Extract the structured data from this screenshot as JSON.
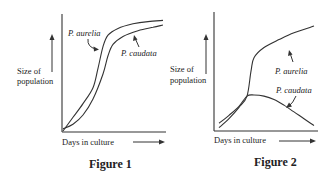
{
  "chart_data": [
    {
      "type": "line",
      "title": "Figure 1",
      "xlabel": "Days in culture",
      "ylabel": "Size of population",
      "axis_units": "qualitative (no ticks)",
      "grid": false,
      "series": [
        {
          "name": "P. aurelia",
          "label": "P. aurelia",
          "x": [
            0,
            0.1,
            0.2,
            0.3,
            0.35,
            0.4,
            0.45,
            0.55,
            0.7,
            0.85,
            1.0
          ],
          "y": [
            0,
            0.12,
            0.24,
            0.38,
            0.55,
            0.74,
            0.84,
            0.9,
            0.94,
            0.96,
            0.97
          ]
        },
        {
          "name": "P. caudata",
          "label": "P. caudata",
          "x": [
            0,
            0.1,
            0.2,
            0.3,
            0.4,
            0.45,
            0.5,
            0.6,
            0.75,
            0.9,
            1.0
          ],
          "y": [
            0.02,
            0.06,
            0.14,
            0.28,
            0.5,
            0.66,
            0.76,
            0.83,
            0.88,
            0.91,
            0.93
          ]
        }
      ]
    },
    {
      "type": "line",
      "title": "Figure 2",
      "xlabel": "Days in culture",
      "ylabel": "Size of population",
      "axis_units": "qualitative (no ticks)",
      "grid": false,
      "series": [
        {
          "name": "P. aurelia",
          "label": "P. aurelia",
          "x": [
            0.05,
            0.15,
            0.25,
            0.33,
            0.37,
            0.4,
            0.5,
            0.65,
            0.8,
            1.0
          ],
          "y": [
            0.02,
            0.1,
            0.2,
            0.3,
            0.52,
            0.64,
            0.73,
            0.8,
            0.86,
            0.92
          ]
        },
        {
          "name": "P. caudata",
          "label": "P. caudata",
          "x": [
            0.05,
            0.15,
            0.25,
            0.33,
            0.4,
            0.5,
            0.6,
            0.7,
            0.8,
            0.9,
            1.0
          ],
          "y": [
            0.06,
            0.13,
            0.21,
            0.3,
            0.31,
            0.3,
            0.27,
            0.22,
            0.16,
            0.1,
            0.04
          ]
        }
      ]
    }
  ],
  "labels": {
    "ylabel_line1": "Size of",
    "ylabel_line2": "population",
    "xlabel": "Days in culture",
    "fig1_title": "Figure 1",
    "fig2_title": "Figure 2",
    "aurelia": "P. aurelia",
    "caudata": "P. caudata"
  }
}
